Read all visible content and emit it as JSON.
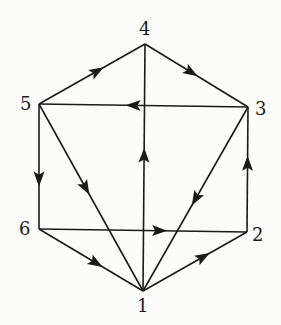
{
  "diagram": {
    "type": "directed-graph",
    "nodes": [
      {
        "id": "1",
        "label": "1",
        "x": 143,
        "y": 291,
        "label_x": 137,
        "label_y": 297
      },
      {
        "id": "2",
        "label": "2",
        "x": 247,
        "y": 232,
        "label_x": 252,
        "label_y": 226
      },
      {
        "id": "3",
        "label": "3",
        "x": 248,
        "y": 107,
        "label_x": 255,
        "label_y": 100
      },
      {
        "id": "4",
        "label": "4",
        "x": 145,
        "y": 44,
        "label_x": 139,
        "label_y": 20
      },
      {
        "id": "5",
        "label": "5",
        "x": 39,
        "y": 104,
        "label_x": 20,
        "label_y": 95
      },
      {
        "id": "6",
        "label": "6",
        "x": 39,
        "y": 229,
        "label_x": 19,
        "label_y": 220
      }
    ],
    "edges": [
      {
        "from": "5",
        "to": "4",
        "arrow_t": 0.55
      },
      {
        "from": "4",
        "to": "3",
        "arrow_t": 0.45
      },
      {
        "from": "3",
        "to": "5",
        "arrow_t": 0.55
      },
      {
        "from": "5",
        "to": "6",
        "arrow_t": 0.6
      },
      {
        "from": "5",
        "to": "1",
        "arrow_t": 0.45
      },
      {
        "from": "1",
        "to": "4",
        "arrow_t": 0.55
      },
      {
        "from": "3",
        "to": "1",
        "arrow_t": 0.5
      },
      {
        "from": "2",
        "to": "3",
        "arrow_t": 0.55
      },
      {
        "from": "6",
        "to": "2",
        "arrow_t": 0.58
      },
      {
        "from": "6",
        "to": "1",
        "arrow_t": 0.55
      },
      {
        "from": "1",
        "to": "2",
        "arrow_t": 0.58
      }
    ]
  }
}
